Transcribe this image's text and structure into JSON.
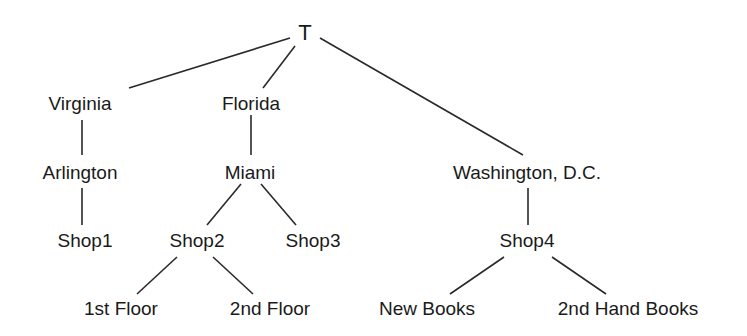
{
  "diagram": {
    "type": "tree",
    "line_color": "#2a2a2a",
    "nodes": [
      {
        "id": "T",
        "label": "T",
        "x": 305,
        "y": 33
      },
      {
        "id": "virginia",
        "label": "Virginia",
        "x": 80,
        "y": 103
      },
      {
        "id": "florida",
        "label": "Florida",
        "x": 251,
        "y": 103
      },
      {
        "id": "washington",
        "label": "Washington, D.C.",
        "x": 527,
        "y": 172
      },
      {
        "id": "arlington",
        "label": "Arlington",
        "x": 80,
        "y": 172
      },
      {
        "id": "miami",
        "label": "Miami",
        "x": 250,
        "y": 172
      },
      {
        "id": "shop1",
        "label": "Shop1",
        "x": 85,
        "y": 240
      },
      {
        "id": "shop2",
        "label": "Shop2",
        "x": 197,
        "y": 240
      },
      {
        "id": "shop3",
        "label": "Shop3",
        "x": 313,
        "y": 240
      },
      {
        "id": "shop4",
        "label": "Shop4",
        "x": 527,
        "y": 240
      },
      {
        "id": "floor1",
        "label": "1st Floor",
        "x": 121,
        "y": 308
      },
      {
        "id": "floor2",
        "label": "2nd Floor",
        "x": 270,
        "y": 308
      },
      {
        "id": "newbooks",
        "label": "New Books",
        "x": 427,
        "y": 308
      },
      {
        "id": "handbooks",
        "label": "2nd Hand Books",
        "x": 628,
        "y": 308
      }
    ],
    "edges": [
      {
        "from": "T",
        "to": "virginia",
        "x1": 290,
        "y1": 38,
        "x2": 129,
        "y2": 88
      },
      {
        "from": "T",
        "to": "florida",
        "x1": 295,
        "y1": 46,
        "x2": 263,
        "y2": 88
      },
      {
        "from": "T",
        "to": "washington",
        "x1": 320,
        "y1": 38,
        "x2": 523,
        "y2": 155
      },
      {
        "from": "virginia",
        "to": "arlington",
        "x1": 82,
        "y1": 120,
        "x2": 82,
        "y2": 155
      },
      {
        "from": "florida",
        "to": "miami",
        "x1": 251,
        "y1": 115,
        "x2": 251,
        "y2": 155
      },
      {
        "from": "arlington",
        "to": "shop1",
        "x1": 82,
        "y1": 188,
        "x2": 82,
        "y2": 225
      },
      {
        "from": "miami",
        "to": "shop2",
        "x1": 241,
        "y1": 184,
        "x2": 207,
        "y2": 225
      },
      {
        "from": "miami",
        "to": "shop3",
        "x1": 261,
        "y1": 184,
        "x2": 296,
        "y2": 225
      },
      {
        "from": "washington",
        "to": "shop4",
        "x1": 528,
        "y1": 188,
        "x2": 528,
        "y2": 225
      },
      {
        "from": "shop2",
        "to": "floor1",
        "x1": 177,
        "y1": 257,
        "x2": 137,
        "y2": 294
      },
      {
        "from": "shop2",
        "to": "floor2",
        "x1": 213,
        "y1": 257,
        "x2": 253,
        "y2": 294
      },
      {
        "from": "shop4",
        "to": "newbooks",
        "x1": 504,
        "y1": 257,
        "x2": 450,
        "y2": 294
      },
      {
        "from": "shop4",
        "to": "handbooks",
        "x1": 552,
        "y1": 257,
        "x2": 606,
        "y2": 294
      }
    ]
  }
}
